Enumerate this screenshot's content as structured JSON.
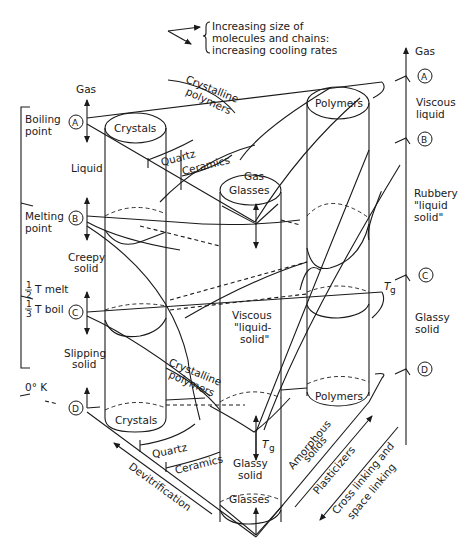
{
  "legend": {
    "line1": "Increasing size of",
    "line2": "molecules and chains:",
    "line3": "increasing cooling rates"
  },
  "left_scale": {
    "boiling_point_1": "Boiling",
    "boiling_point_2": "point",
    "melting_point_1": "Melting",
    "melting_point_2": "point",
    "half_tmelt_num": "1",
    "half_tmelt_den": "2",
    "half_tmelt_text": "T melt",
    "third_tboil_num": "1",
    "third_tboil_den": "3",
    "third_tboil_text": "T boil",
    "zero_k": "0° K"
  },
  "state_markers": {
    "A": "A",
    "B": "B",
    "C": "C",
    "D": "D"
  },
  "left_states": {
    "gas": "Gas",
    "liquid": "Liquid",
    "creepy_1": "Creepy",
    "creepy_2": "solid",
    "slipping_1": "Slipping",
    "slipping_2": "solid"
  },
  "cylinders": {
    "crystals_top": "Crystals",
    "crystals_bottom": "Crystals",
    "glasses_top": "Glasses",
    "glasses_bottom": "Glasses",
    "polymers_top": "Polymers",
    "polymers_bottom": "Polymers"
  },
  "center_labels": {
    "gas": "Gas",
    "viscous_1": "Viscous",
    "viscous_2": "\"liquid-",
    "viscous_3": "solid\"",
    "glassy_1": "Glassy",
    "glassy_2": "solid",
    "tg": "T",
    "tg_sub": "g"
  },
  "curve_labels": {
    "crystalline_top_1": "Crystalline",
    "crystalline_top_2": "polymers",
    "quartz_top": "Quartz",
    "ceramics_top": "Ceramics",
    "crystalline_mid_1": "Crystalline",
    "crystalline_mid_2": "polymers",
    "quartz_bottom": "Quartz",
    "ceramics_bottom": "Ceramics"
  },
  "right_scale": {
    "gas": "Gas",
    "viscous_1": "Viscous",
    "viscous_2": "liquid",
    "rubbery_1": "Rubbery",
    "rubbery_2": "\"liquid",
    "rubbery_3": "solid\"",
    "glassy_1": "Glassy",
    "glassy_2": "solid",
    "tg": "T",
    "tg_sub": "g"
  },
  "axes": {
    "devitrification": "Devitrification",
    "amorphous_1": "Amorphous",
    "amorphous_2": "solids",
    "plasticizers": "Plasticizers",
    "cross_1": "Cross linking and",
    "cross_2": "space linking"
  }
}
